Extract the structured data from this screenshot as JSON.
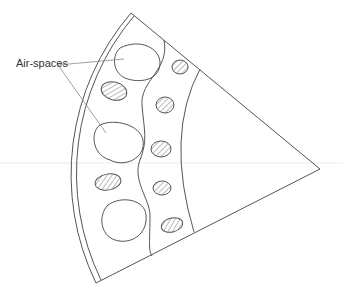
{
  "diagram": {
    "labels": {
      "air_spaces": "Air-spaces"
    },
    "colors": {
      "stroke": "#555555",
      "hatch": "#777777",
      "background": "#ffffff",
      "guide_line": "#e6e6e6"
    }
  }
}
